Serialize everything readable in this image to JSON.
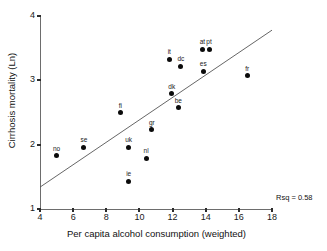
{
  "chart_data": {
    "type": "scatter",
    "title": "",
    "xlabel": "Per capita alcohol consumption (weighted)",
    "ylabel": "Cirrhosis mortality (Ln)",
    "xlim": [
      4,
      18
    ],
    "ylim": [
      1,
      4
    ],
    "xticks": [
      "4",
      "6",
      "8",
      "10",
      "12",
      "14",
      "16",
      "18"
    ],
    "yticks": [
      "1",
      "2",
      "3",
      "4"
    ],
    "grid": false,
    "legend": "none",
    "annotation": "Rsq = 0.58",
    "point_color": "#0b0b0b",
    "line_color": "#555555",
    "points": [
      {
        "label": "no",
        "x": 5.0,
        "y": 1.83
      },
      {
        "label": "se",
        "x": 6.65,
        "y": 1.96
      },
      {
        "label": "fi",
        "x": 8.85,
        "y": 2.5
      },
      {
        "label": "uk",
        "x": 9.35,
        "y": 1.96
      },
      {
        "label": "ie",
        "x": 9.35,
        "y": 1.43
      },
      {
        "label": "nl",
        "x": 10.4,
        "y": 1.79
      },
      {
        "label": "gr",
        "x": 10.75,
        "y": 2.23
      },
      {
        "label": "it",
        "x": 11.8,
        "y": 3.33
      },
      {
        "label": "dk",
        "x": 11.95,
        "y": 2.79
      },
      {
        "label": "be",
        "x": 12.35,
        "y": 2.57
      },
      {
        "label": "dc",
        "x": 12.5,
        "y": 3.22
      },
      {
        "label": "at",
        "x": 13.8,
        "y": 3.48
      },
      {
        "label": "es",
        "x": 13.85,
        "y": 3.14
      },
      {
        "label": "pt",
        "x": 14.2,
        "y": 3.48
      },
      {
        "label": "fr",
        "x": 16.5,
        "y": 3.07
      }
    ],
    "trendline": {
      "x1": 4,
      "y1": 1.34,
      "x2": 18,
      "y2": 3.78
    }
  }
}
